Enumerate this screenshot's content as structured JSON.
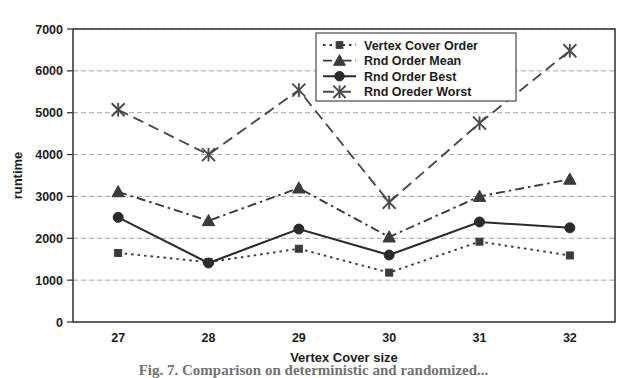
{
  "figure": {
    "caption": "Fig. 7. Comparison on deterministic and randomized..."
  },
  "chart_data": {
    "type": "line",
    "title": "",
    "xlabel": "Vertex Cover size",
    "ylabel": "runtime",
    "categories": [
      "27",
      "28",
      "29",
      "30",
      "31",
      "32"
    ],
    "xlim": [
      26.5,
      32.5
    ],
    "ylim": [
      0,
      7000
    ],
    "yticks": [
      0,
      1000,
      2000,
      3000,
      4000,
      5000,
      6000,
      7000
    ],
    "grid": "horizontal",
    "legend_position": "top-right",
    "series": [
      {
        "name": "Vertex Cover Order",
        "marker": "square",
        "linestyle": "dotted",
        "color": "#3b3b3b",
        "values": [
          1650,
          1430,
          1750,
          1180,
          1920,
          1590
        ]
      },
      {
        "name": "Rnd Order Mean",
        "marker": "triangle",
        "linestyle": "dash-dot",
        "color": "#3b3b3b",
        "values": [
          3110,
          2420,
          3200,
          2030,
          3000,
          3410
        ]
      },
      {
        "name": "Rnd Order Best",
        "marker": "circle",
        "linestyle": "solid",
        "color": "#2b2b2b",
        "values": [
          2500,
          1410,
          2220,
          1600,
          2390,
          2250
        ]
      },
      {
        "name": "Rnd Oreder Worst",
        "marker": "asterisk",
        "linestyle": "dashed",
        "color": "#4a4a4a",
        "values": [
          5070,
          4000,
          5540,
          2860,
          4750,
          6480
        ]
      }
    ]
  }
}
